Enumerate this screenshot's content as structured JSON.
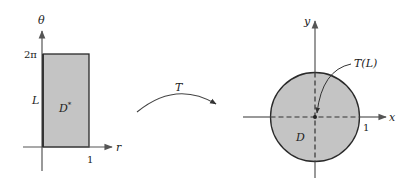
{
  "figure": {
    "left_panel": {
      "axes": {
        "vertical_label": "θ",
        "horizontal_label": "r"
      },
      "ticks": {
        "top": "2π",
        "right": "1"
      },
      "segment_label": "L",
      "region_label": "D",
      "region_superscript": "*"
    },
    "mapping": {
      "label": "T"
    },
    "right_panel": {
      "axes": {
        "vertical_label": "y",
        "horizontal_label": "x"
      },
      "ticks": {
        "right": "1"
      },
      "region_label": "D",
      "image_label": "T(L)"
    },
    "colors": {
      "fill": "#c4c4c4",
      "stroke": "#2a2a2a",
      "axis": "#555555"
    }
  }
}
